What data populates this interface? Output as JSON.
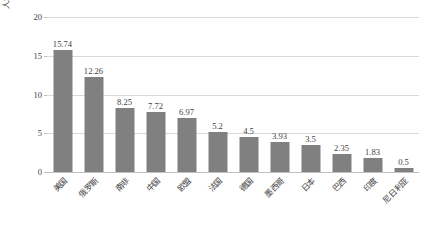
{
  "chart_data": {
    "type": "bar",
    "title": "",
    "xlabel": "",
    "ylabel": "人均二氧化碳排放量（吨）",
    "ylim": [
      0,
      20
    ],
    "yticks": [
      0,
      5,
      10,
      15,
      20
    ],
    "ytick_labels": [
      "0",
      "5",
      "10",
      "15",
      "20"
    ],
    "grid": "horizontal",
    "legend": "none",
    "bar_color": "#808080",
    "gridline_color": "#D9D9D9",
    "text_color": "#3F3F3F",
    "categories": [
      "美国",
      "俄罗斯",
      "南非",
      "中国",
      "欧盟",
      "法国",
      "德国",
      "墨西哥",
      "日本",
      "巴西",
      "印度",
      "尼日利亚"
    ],
    "values": [
      15.74,
      12.26,
      8.25,
      7.72,
      6.97,
      5.2,
      4.5,
      3.93,
      3.5,
      2.35,
      1.83,
      0.5
    ],
    "value_labels": [
      "15.74",
      "12.26",
      "8.25",
      "7.72",
      "6.97",
      "5.2",
      "4.5",
      "3.93",
      "3.5",
      "2.35",
      "1.83",
      "0.5"
    ]
  }
}
